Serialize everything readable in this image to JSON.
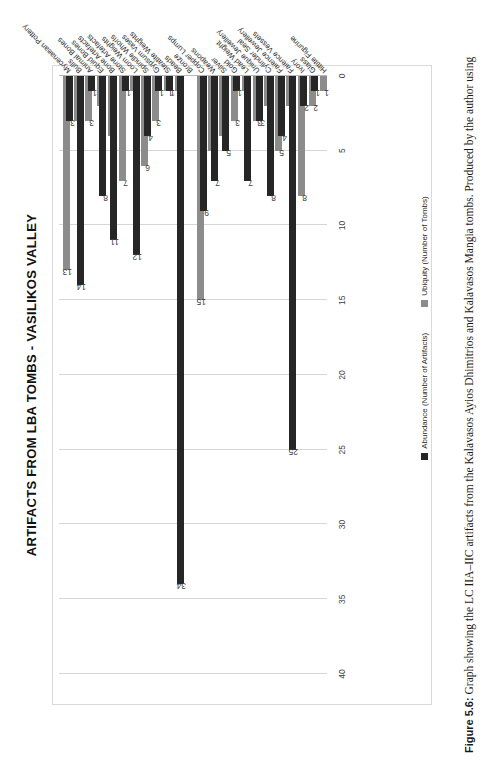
{
  "figure": {
    "caption_label": "Figure 5.6:",
    "caption_text": " Graph showing the LC IIA–IIC artifacts from the Kalavasos Ayios Dhimitrios and Kalavasos Mangia tombs. Produced by the author using"
  },
  "legend": {
    "position": "bottom",
    "items": [
      {
        "label": "Abundance (Number of Artifacts)",
        "color": "#262626"
      },
      {
        "label": "Ubiquity (Number of Tombs)",
        "color": "#8c8c8c"
      }
    ]
  },
  "chart_data": {
    "type": "bar",
    "orientation": "vertical",
    "title": "ARTIFACTS FROM LBA TOMBS - VASILIKOS VALLEY",
    "xlabel": "",
    "ylabel": "",
    "ylim": [
      0,
      40
    ],
    "yticks": [
      0,
      5,
      10,
      15,
      20,
      25,
      30,
      35,
      40
    ],
    "grid": true,
    "categories": [
      "Mycenaean Pottery",
      "Bulls",
      "Animal Bones",
      "Equid Bones",
      "Bone Artefacts",
      "Stone Artefacts",
      "Loom Weights",
      "Spindle Whorls",
      "Gypsum Vases",
      "Steatite Weights",
      "Beads",
      "Bronze",
      "Copper Lumps",
      "Weapons",
      "Silver",
      "Gold",
      "Lead Weight",
      "Unique Jewellery",
      "Cylinder Seal",
      "Faience Jewellery",
      "Faience Vessels",
      "Ivory",
      "Glass",
      "Hittite Figurine"
    ],
    "series": [
      {
        "name": "Abundance (Number of Artifacts)",
        "color": "#262626",
        "values": [
          null,
          3,
          14,
          1,
          8,
          11,
          1,
          12,
          4,
          1,
          1,
          34,
          null,
          9,
          7,
          5,
          1,
          7,
          3,
          8,
          4,
          25,
          2,
          1
        ]
      },
      {
        "name": "Ubiquity (Number of Tombs)",
        "color": "#8c8c8c",
        "values": [
          13,
          3,
          3,
          2,
          4,
          7,
          1,
          6,
          3,
          1,
          1,
          null,
          15,
          5,
          4,
          3,
          1,
          3,
          2,
          5,
          2,
          8,
          2,
          1
        ]
      }
    ],
    "point_labels": {
      "Mycenaean Pottery": {
        "ubiquity": "13"
      },
      "Bulls": {
        "abundance": "3",
        "ubiquity": "3"
      },
      "Animal Bones": {
        "abundance": "14",
        "ubiquity": "3"
      },
      "Equid Bones": {
        "abundance": "1",
        "ubiquity": "2"
      },
      "Bone Artefacts": {
        "abundance": "8",
        "ubiquity": "4"
      },
      "Stone Artefacts": {
        "abundance": "11",
        "ubiquity": "7"
      },
      "Loom Weights": {
        "abundance": "1",
        "ubiquity": "1"
      },
      "Spindle Whorls": {
        "abundance": "12",
        "ubiquity": "6"
      },
      "Gypsum Vases": {
        "abundance": "4",
        "ubiquity": "3"
      },
      "Steatite Weights": {
        "abundance": "1",
        "ubiquity": "1"
      },
      "Beads": {
        "abundance": "1",
        "ubiquity": "1"
      },
      "Bronze": {
        "abundance": "34"
      },
      "Copper Lumps": {
        "ubiquity": "15"
      },
      "Weapons": {
        "abundance": "9",
        "ubiquity": "5"
      },
      "Silver": {
        "abundance": "7",
        "ubiquity": "4"
      },
      "Gold": {
        "abundance": "5",
        "ubiquity": "3"
      },
      "Lead Weight": {
        "abundance": "1",
        "ubiquity": "1"
      },
      "Unique Jewellery": {
        "abundance": "7",
        "ubiquity": "3"
      },
      "Cylinder Seal": {
        "abundance": "3",
        "ubiquity": "2"
      },
      "Faience Jewellery": {
        "abundance": "8",
        "ubiquity": "5"
      },
      "Faience Vessels": {
        "abundance": "4",
        "ubiquity": "2"
      },
      "Ivory": {
        "abundance": "25",
        "ubiquity": "8"
      },
      "Glass": {
        "abundance": "2",
        "ubiquity": "2"
      },
      "Hittite Figurine": {
        "abundance": "1",
        "ubiquity": "1"
      }
    }
  }
}
